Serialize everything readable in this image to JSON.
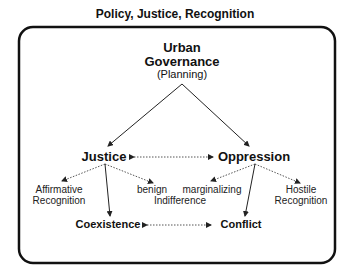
{
  "title": "Policy, Justice, Recognition",
  "nodes": {
    "root": {
      "line1": "Urban",
      "line2": "Governance",
      "line3": "(Planning)"
    },
    "justice": "Justice",
    "oppression": "Oppression",
    "affirmative": {
      "line1": "Affirmative",
      "line2": "Recognition"
    },
    "benign": "benign",
    "indifference": "Indifference",
    "marginalizing": "marginalizing",
    "hostile": {
      "line1": "Hostile",
      "line2": "Recognition"
    },
    "coexistence": "Coexistence",
    "conflict": "Conflict"
  },
  "colors": {
    "line": "#222222",
    "dotted": "#555555",
    "border": "#111111"
  }
}
